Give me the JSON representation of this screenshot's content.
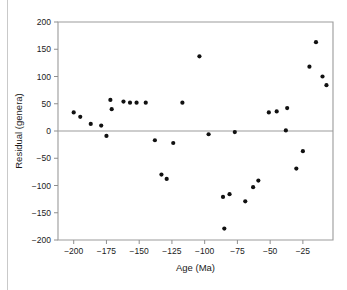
{
  "figure": {
    "name": "residual-vs-age-scatter",
    "background_color": "#ffffff",
    "marker_color": "#111111",
    "axis_color": "#9b9b9b"
  },
  "chart_data": {
    "type": "scatter",
    "title": "",
    "xlabel": "Age (Ma)",
    "ylabel": "Residual (genera)",
    "xlim": [
      -212,
      -2
    ],
    "ylim": [
      -200,
      200
    ],
    "xticks": [
      -200,
      -175,
      -150,
      -125,
      -100,
      -75,
      -50,
      -25
    ],
    "xticklabels": [
      "−200",
      "−175",
      "−150",
      "−125",
      "−100",
      "−75",
      "−50",
      "−25"
    ],
    "yticks": [
      200,
      150,
      100,
      50,
      0,
      -50,
      -100,
      -150,
      -200
    ],
    "yticklabels": [
      "200",
      "150",
      "100",
      "50",
      "0",
      "−50",
      "−100",
      "−150",
      "−200"
    ],
    "grid": false,
    "legend": null,
    "zero_reference_line": 0,
    "points": [
      {
        "x": -200,
        "y": 34
      },
      {
        "x": -195,
        "y": 26
      },
      {
        "x": -187,
        "y": 13
      },
      {
        "x": -179,
        "y": 10
      },
      {
        "x": -172,
        "y": 57
      },
      {
        "x": -171,
        "y": 40
      },
      {
        "x": -175,
        "y": -9
      },
      {
        "x": -162,
        "y": 54
      },
      {
        "x": -157,
        "y": 52
      },
      {
        "x": -152,
        "y": 52
      },
      {
        "x": -145,
        "y": 52
      },
      {
        "x": -138,
        "y": -17
      },
      {
        "x": -133,
        "y": -80
      },
      {
        "x": -129,
        "y": -88
      },
      {
        "x": -124,
        "y": -22
      },
      {
        "x": -117,
        "y": 52
      },
      {
        "x": -104,
        "y": 137
      },
      {
        "x": -97,
        "y": -6
      },
      {
        "x": -86,
        "y": -121
      },
      {
        "x": -85,
        "y": -179
      },
      {
        "x": -81,
        "y": -116
      },
      {
        "x": -77,
        "y": -2
      },
      {
        "x": -69,
        "y": -129
      },
      {
        "x": -63,
        "y": -103
      },
      {
        "x": -59,
        "y": -91
      },
      {
        "x": -51,
        "y": 34
      },
      {
        "x": -45,
        "y": 36
      },
      {
        "x": -38,
        "y": 1
      },
      {
        "x": -37,
        "y": 42
      },
      {
        "x": -30,
        "y": -69
      },
      {
        "x": -25,
        "y": -37
      },
      {
        "x": -20,
        "y": 118
      },
      {
        "x": -15,
        "y": 163
      },
      {
        "x": -10,
        "y": 100
      },
      {
        "x": -7,
        "y": 84
      }
    ]
  }
}
